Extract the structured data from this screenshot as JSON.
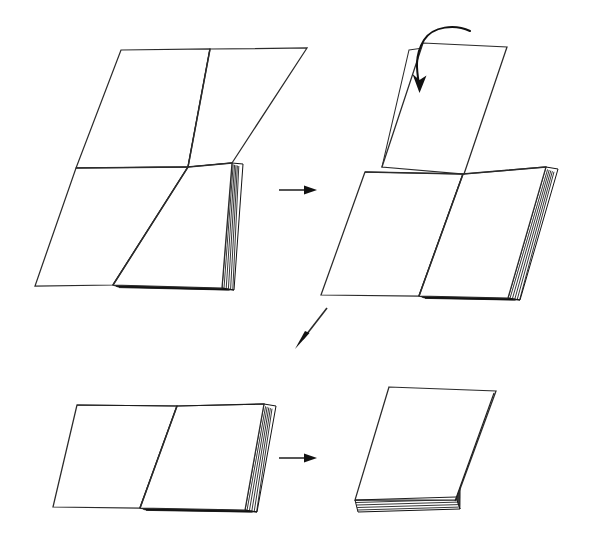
{
  "figure": {
    "background_color": "#ffffff",
    "line_color": "#2b2b2b",
    "arrow_color": "#111111",
    "panel_count": 4,
    "panels": [
      {
        "id": "panel-1",
        "position": "top-left",
        "step_number": "1",
        "label": "",
        "object": "open-folio-stack",
        "description": "Opened folded stack lying flat, showing a horizontal crease across the middle and a vertical spine crease, with a thick stack of page edges along the right side"
      },
      {
        "id": "panel-2",
        "position": "top-right",
        "step_number": "2",
        "label": "",
        "object": "folio-stack-with-raised-flap",
        "description": "Same stack with the upper half lifted upright as a standing flap; a curved arrow indicates folding the flap downward and forward"
      },
      {
        "id": "panel-3",
        "position": "bottom-left",
        "step_number": "3",
        "label": "",
        "object": "half-folded-open-booklet",
        "description": "Result after the first fold: an open booklet with a single vertical spine crease and thick page edges on the right"
      },
      {
        "id": "panel-4",
        "position": "bottom-right",
        "step_number": "4",
        "label": "",
        "object": "closed-booklet",
        "description": "Final closed booklet, a single rectangular block with visible page edges along the bottom"
      }
    ],
    "arrows": [
      {
        "id": "arrow-1",
        "type": "straight",
        "direction": "right",
        "from_panel": "panel-1",
        "to_panel": "panel-2",
        "label": ""
      },
      {
        "id": "arrow-fold",
        "type": "curved",
        "direction": "fold-down-left",
        "in_panel": "panel-2",
        "label": ""
      },
      {
        "id": "arrow-2",
        "type": "straight",
        "direction": "down-left-diagonal",
        "from_panel": "panel-2",
        "to_panel": "panel-3",
        "label": ""
      },
      {
        "id": "arrow-3",
        "type": "straight",
        "direction": "right",
        "from_panel": "panel-3",
        "to_panel": "panel-4",
        "label": ""
      }
    ]
  }
}
